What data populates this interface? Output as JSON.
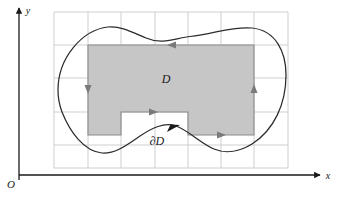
{
  "figure": {
    "width": 339,
    "height": 197,
    "background_color": "#ffffff"
  },
  "axes": {
    "x_axis": {
      "label": "x",
      "name": "x-axis",
      "color": "#1a1a1a",
      "y_position": 175,
      "x_start": 19,
      "x_end": 320,
      "arrow": "right"
    },
    "y_axis": {
      "label": "y",
      "name": "y-axis",
      "color": "#1a1a1a",
      "x_position": 19,
      "y_start": 178,
      "y_end": 8,
      "arrow": "up"
    },
    "origin": {
      "label": "O",
      "x": 11,
      "y": 186
    }
  },
  "grid": {
    "color": "#c9c9cf",
    "vertical_lines_x": [
      54,
      88,
      121,
      155,
      188,
      221,
      254,
      288
    ],
    "horizontal_lines_y": [
      12,
      45,
      78,
      112,
      145,
      168
    ],
    "x_min": 54,
    "x_max": 288,
    "y_min": 12,
    "y_max": 168,
    "spacing": 33.3,
    "visible": true
  },
  "region": {
    "label": "D",
    "label_x": 166,
    "label_y": 79,
    "fill_color": "#c6c6c6",
    "stroke_color": "#8a8a8a",
    "description": "shaded rectangle with a rectangular notch cut out of the bottom edge",
    "rect": {
      "left": 88,
      "top": 45,
      "right": 254,
      "bottom": 135
    },
    "notch": {
      "left": 121,
      "top": 112,
      "right": 188,
      "bottom": 135
    }
  },
  "boundary": {
    "label": "∂D",
    "label_x": 157,
    "label_y": 141,
    "stroke_color": "#2b2b2b",
    "description": "smooth closed blob curve enclosing the shaded region, oriented counterclockwise",
    "extremes": {
      "left_x": 58,
      "left_y": 90,
      "right_x": 286,
      "right_y": 75,
      "top_peak_x": 122,
      "top_peak_y": 27,
      "bottom_dip_left_x": 105,
      "bottom_dip_left_y": 153,
      "bottom_dip_right_x": 235,
      "bottom_dip_right_y": 153
    }
  },
  "arrows": [
    {
      "name": "rect-top-edge-arrow",
      "direction": "left",
      "x": 172,
      "y": 45,
      "color": "#7a7a7a",
      "on": "region-top-edge"
    },
    {
      "name": "rect-left-edge-arrow",
      "direction": "down",
      "x": 88,
      "y": 89,
      "color": "#7a7a7a",
      "on": "region-left-edge"
    },
    {
      "name": "rect-right-edge-arrow",
      "direction": "up",
      "x": 254,
      "y": 89,
      "color": "#7a7a7a",
      "on": "region-right-edge"
    },
    {
      "name": "rect-bottom-right-edge-arrow",
      "direction": "right",
      "x": 221,
      "y": 135,
      "color": "#7a7a7a",
      "on": "region-bottom-right-edge"
    },
    {
      "name": "notch-top-edge-arrow",
      "direction": "right",
      "x": 153,
      "y": 112,
      "color": "#7a7a7a",
      "on": "region-notch-top-edge"
    },
    {
      "name": "boundary-curve-arrow",
      "direction": "up-right",
      "x": 173,
      "y": 128,
      "color": "#1a1a1a",
      "on": "boundary-curve"
    }
  ]
}
